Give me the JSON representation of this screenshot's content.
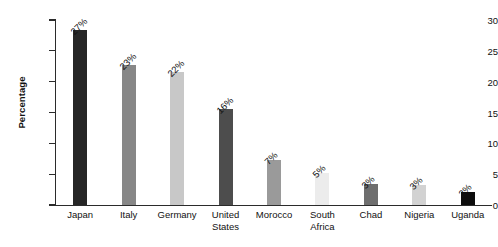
{
  "chart_data": {
    "type": "bar",
    "title": "",
    "subtitle": "",
    "xlabel": "",
    "ylabel": "Percentage",
    "ylim": [
      0,
      30
    ],
    "ytick_values": [
      0,
      5,
      10,
      15,
      20,
      25,
      30
    ],
    "ytick_labels": [
      "0",
      "5",
      "10",
      "15",
      "20",
      "25",
      "30"
    ],
    "grid": false,
    "legend": false,
    "legend_position": "none",
    "categories": [
      "Japan",
      "Italy",
      "Germany",
      "United States",
      "Morocco",
      "South Africa",
      "Chad",
      "Nigeria",
      "Uganda"
    ],
    "values": [
      28.3,
      22.7,
      21.5,
      15.6,
      7.3,
      5.2,
      3.4,
      3.2,
      2.1
    ],
    "data_labels": [
      "27%",
      "23%",
      "22%",
      "16%",
      "7%",
      "5%",
      "3%",
      "3%",
      "2%"
    ],
    "bar_colors": [
      "#262626",
      "#878787",
      "#c8c8c8",
      "#4d4d4d",
      "#9a9a9a",
      "#ececec",
      "#6e6e6e",
      "#d2d2d2",
      "#0d0d0d"
    ],
    "axis_color": "#2b2b2b",
    "text_color": "#111111",
    "background_color": "#ffffff",
    "data_label_rotation_deg": 45
  },
  "bars": [
    {
      "label_line1": "Japan",
      "label_line2": "",
      "data_label": "27%",
      "value": 28.3,
      "color": "#262626"
    },
    {
      "label_line1": "Italy",
      "label_line2": "",
      "data_label": "23%",
      "value": 22.7,
      "color": "#878787"
    },
    {
      "label_line1": "Germany",
      "label_line2": "",
      "data_label": "22%",
      "value": 21.5,
      "color": "#c8c8c8"
    },
    {
      "label_line1": "United",
      "label_line2": "States",
      "data_label": "16%",
      "value": 15.6,
      "color": "#4d4d4d"
    },
    {
      "label_line1": "Morocco",
      "label_line2": "",
      "data_label": "7%",
      "value": 7.3,
      "color": "#9a9a9a"
    },
    {
      "label_line1": "South",
      "label_line2": "Africa",
      "data_label": "5%",
      "value": 5.2,
      "color": "#ececec"
    },
    {
      "label_line1": "Chad",
      "label_line2": "",
      "data_label": "3%",
      "value": 3.4,
      "color": "#6e6e6e"
    },
    {
      "label_line1": "Nigeria",
      "label_line2": "",
      "data_label": "3%",
      "value": 3.2,
      "color": "#d2d2d2"
    },
    {
      "label_line1": "Uganda",
      "label_line2": "",
      "data_label": "2%",
      "value": 2.1,
      "color": "#0d0d0d"
    }
  ],
  "yaxis": {
    "title": "Percentage",
    "ticks": [
      "0",
      "5",
      "10",
      "15",
      "20",
      "25",
      "30"
    ]
  }
}
